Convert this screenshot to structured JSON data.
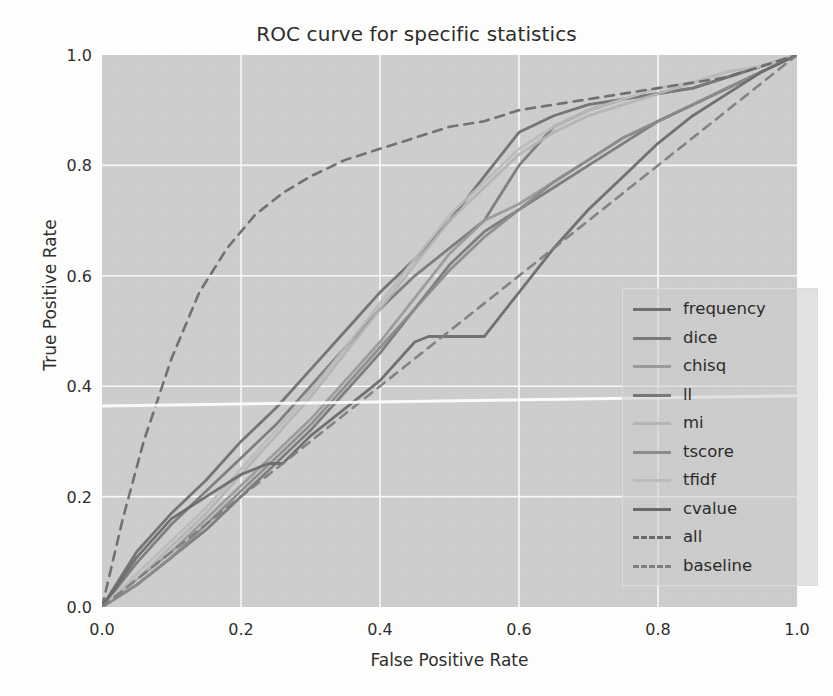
{
  "chart_data": {
    "type": "line",
    "title": "ROC curve for specific statistics",
    "xlabel": "False Positive Rate",
    "ylabel": "True Positive Rate",
    "xlim": [
      0.0,
      1.0
    ],
    "ylim": [
      0.0,
      1.0
    ],
    "xticks": [
      "0.0",
      "0.2",
      "0.4",
      "0.6",
      "0.8",
      "1.0"
    ],
    "yticks": [
      "0.0",
      "0.2",
      "0.4",
      "0.6",
      "0.8",
      "1.0"
    ],
    "grid": true,
    "legend_position": "lower right",
    "plot_background": "#cecece",
    "grid_color": "#ffffff",
    "series": [
      {
        "name": "frequency",
        "color": "#6f6f6f",
        "linestyle": "solid",
        "x": [
          0.0,
          0.05,
          0.1,
          0.15,
          0.2,
          0.25,
          0.3,
          0.35,
          0.4,
          0.45,
          0.5,
          0.55,
          0.6,
          0.65,
          0.7,
          0.75,
          0.8,
          0.85,
          0.9,
          0.95,
          1.0
        ],
        "y": [
          0.0,
          0.1,
          0.17,
          0.23,
          0.3,
          0.36,
          0.43,
          0.5,
          0.57,
          0.63,
          0.7,
          0.78,
          0.86,
          0.89,
          0.91,
          0.92,
          0.93,
          0.94,
          0.96,
          0.98,
          1.0
        ]
      },
      {
        "name": "dice",
        "color": "#7a7a7a",
        "linestyle": "solid",
        "x": [
          0.0,
          0.05,
          0.1,
          0.15,
          0.2,
          0.25,
          0.3,
          0.35,
          0.4,
          0.45,
          0.5,
          0.55,
          0.6,
          0.65,
          0.7,
          0.75,
          0.8,
          0.85,
          0.9,
          0.95,
          1.0
        ],
        "y": [
          0.0,
          0.08,
          0.15,
          0.21,
          0.27,
          0.33,
          0.4,
          0.47,
          0.54,
          0.6,
          0.65,
          0.7,
          0.8,
          0.87,
          0.9,
          0.92,
          0.93,
          0.94,
          0.96,
          0.98,
          1.0
        ]
      },
      {
        "name": "chisq",
        "color": "#9a9a9a",
        "linestyle": "solid",
        "x": [
          0.0,
          0.05,
          0.1,
          0.15,
          0.2,
          0.25,
          0.3,
          0.35,
          0.4,
          0.45,
          0.5,
          0.55,
          0.6,
          0.65,
          0.7,
          0.75,
          0.8,
          0.85,
          0.9,
          0.95,
          1.0
        ],
        "y": [
          0.0,
          0.05,
          0.1,
          0.16,
          0.22,
          0.28,
          0.34,
          0.41,
          0.48,
          0.56,
          0.64,
          0.7,
          0.73,
          0.77,
          0.81,
          0.85,
          0.88,
          0.91,
          0.94,
          0.97,
          1.0
        ]
      },
      {
        "name": "ll",
        "color": "#787878",
        "linestyle": "solid",
        "x": [
          0.0,
          0.05,
          0.1,
          0.15,
          0.2,
          0.25,
          0.3,
          0.35,
          0.4,
          0.45,
          0.5,
          0.55,
          0.6,
          0.65,
          0.7,
          0.75,
          0.8,
          0.85,
          0.9,
          0.95,
          1.0
        ],
        "y": [
          0.0,
          0.04,
          0.09,
          0.14,
          0.2,
          0.26,
          0.32,
          0.39,
          0.46,
          0.54,
          0.62,
          0.68,
          0.72,
          0.76,
          0.8,
          0.84,
          0.88,
          0.91,
          0.94,
          0.97,
          1.0
        ]
      },
      {
        "name": "mi",
        "color": "#b5b5b5",
        "linestyle": "solid",
        "x": [
          0.0,
          0.05,
          0.1,
          0.15,
          0.2,
          0.25,
          0.3,
          0.35,
          0.4,
          0.45,
          0.5,
          0.55,
          0.6,
          0.65,
          0.7,
          0.75,
          0.8,
          0.85,
          0.9,
          0.95,
          1.0
        ],
        "y": [
          0.0,
          0.05,
          0.11,
          0.17,
          0.24,
          0.31,
          0.38,
          0.46,
          0.54,
          0.62,
          0.7,
          0.76,
          0.82,
          0.86,
          0.89,
          0.91,
          0.93,
          0.95,
          0.97,
          0.98,
          1.0
        ]
      },
      {
        "name": "tscore",
        "color": "#8c8c8c",
        "linestyle": "solid",
        "x": [
          0.0,
          0.05,
          0.1,
          0.15,
          0.2,
          0.25,
          0.3,
          0.35,
          0.4,
          0.45,
          0.5,
          0.55,
          0.6,
          0.65,
          0.7,
          0.75,
          0.8,
          0.85,
          0.9,
          0.95,
          1.0
        ],
        "y": [
          0.0,
          0.04,
          0.09,
          0.15,
          0.21,
          0.27,
          0.33,
          0.4,
          0.47,
          0.54,
          0.61,
          0.67,
          0.72,
          0.77,
          0.81,
          0.85,
          0.88,
          0.91,
          0.94,
          0.97,
          1.0
        ]
      },
      {
        "name": "tfidf",
        "color": "#bcbcbc",
        "linestyle": "solid",
        "x": [
          0.0,
          0.05,
          0.1,
          0.15,
          0.2,
          0.25,
          0.3,
          0.35,
          0.4,
          0.45,
          0.5,
          0.55,
          0.6,
          0.65,
          0.7,
          0.75,
          0.8,
          0.85,
          0.9,
          0.95,
          1.0
        ],
        "y": [
          0.0,
          0.06,
          0.12,
          0.18,
          0.25,
          0.32,
          0.39,
          0.47,
          0.55,
          0.63,
          0.71,
          0.77,
          0.83,
          0.87,
          0.9,
          0.92,
          0.94,
          0.95,
          0.97,
          0.98,
          1.0
        ]
      },
      {
        "name": "cvalue",
        "color": "#6a6a6a",
        "linestyle": "solid",
        "x": [
          0.0,
          0.05,
          0.1,
          0.15,
          0.2,
          0.24,
          0.26,
          0.3,
          0.35,
          0.4,
          0.45,
          0.47,
          0.55,
          0.6,
          0.65,
          0.7,
          0.75,
          0.8,
          0.85,
          0.9,
          0.95,
          1.0
        ],
        "y": [
          0.0,
          0.09,
          0.16,
          0.2,
          0.24,
          0.26,
          0.26,
          0.31,
          0.36,
          0.41,
          0.48,
          0.49,
          0.49,
          0.57,
          0.65,
          0.72,
          0.78,
          0.84,
          0.89,
          0.93,
          0.97,
          1.0
        ]
      },
      {
        "name": "all",
        "color": "#6b6b6b",
        "linestyle": "dashed",
        "x": [
          0.0,
          0.03,
          0.06,
          0.1,
          0.14,
          0.18,
          0.22,
          0.26,
          0.3,
          0.35,
          0.4,
          0.45,
          0.5,
          0.55,
          0.6,
          0.65,
          0.7,
          0.75,
          0.8,
          0.85,
          0.9,
          0.95,
          1.0
        ],
        "y": [
          0.0,
          0.16,
          0.3,
          0.45,
          0.57,
          0.65,
          0.71,
          0.75,
          0.78,
          0.81,
          0.83,
          0.85,
          0.87,
          0.88,
          0.9,
          0.91,
          0.92,
          0.93,
          0.94,
          0.95,
          0.96,
          0.98,
          1.0
        ]
      },
      {
        "name": "baseline",
        "color": "#7e7e7e",
        "linestyle": "dashed",
        "x": [
          0.0,
          1.0
        ],
        "y": [
          0.0,
          1.0
        ]
      }
    ]
  },
  "legend": {
    "entries": [
      {
        "label": "frequency"
      },
      {
        "label": "dice"
      },
      {
        "label": "chisq"
      },
      {
        "label": "ll"
      },
      {
        "label": "mi"
      },
      {
        "label": "tscore"
      },
      {
        "label": "tfidf"
      },
      {
        "label": "cvalue"
      },
      {
        "label": "all"
      },
      {
        "label": "baseline"
      }
    ]
  }
}
